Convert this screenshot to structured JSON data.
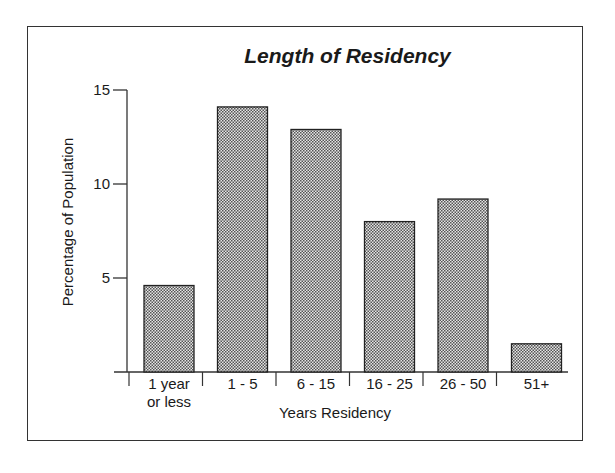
{
  "chart_data": {
    "type": "bar",
    "title": "Length of Residency",
    "xlabel": "Years Residency",
    "ylabel": "Percentage of Population",
    "categories": [
      "1 year or less",
      "1 - 5",
      "6 - 15",
      "16 - 25",
      "26 - 50",
      "51+"
    ],
    "category_lines": [
      [
        "1 year",
        "or less"
      ],
      [
        "1 - 5"
      ],
      [
        "6 - 15"
      ],
      [
        "16 - 25"
      ],
      [
        "26 - 50"
      ],
      [
        "51+"
      ]
    ],
    "values": [
      4.6,
      14.1,
      12.9,
      8.0,
      9.2,
      1.5
    ],
    "yticks": [
      5,
      10,
      15
    ],
    "ylim": [
      0,
      15
    ],
    "grid": false,
    "legend": null,
    "bar_fill": "stippled gray",
    "colors": {
      "bar_fill": "#b8b8b8",
      "bar_stroke": "#222222",
      "axis": "#333333"
    }
  }
}
